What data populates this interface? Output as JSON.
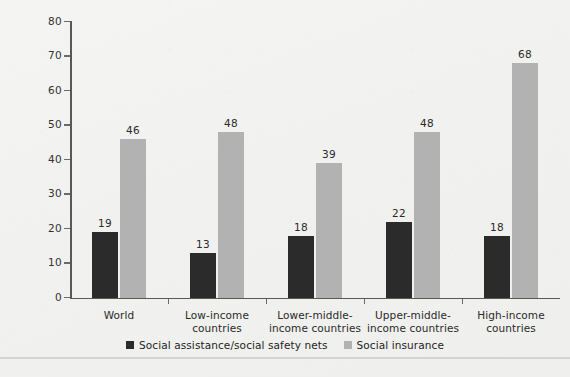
{
  "chart_data": {
    "type": "bar",
    "title": "",
    "xlabel": "",
    "ylabel": "Percent",
    "ylim": [
      0,
      80
    ],
    "ytick_step": 10,
    "yticks": [
      "0",
      "10",
      "20",
      "30",
      "40",
      "50",
      "60",
      "70",
      "80"
    ],
    "grid": false,
    "legend_position": "bottom-center",
    "categories": [
      "World",
      "Low-income countries",
      "Lower-middle-income countries",
      "Upper-middle-income countries",
      "High-income countries"
    ],
    "category_label_lines": [
      [
        "World"
      ],
      [
        "Low-income",
        "countries"
      ],
      [
        "Lower-middle-",
        "income countries"
      ],
      [
        "Upper-middle-",
        "income countries"
      ],
      [
        "High-income",
        "countries"
      ]
    ],
    "series": [
      {
        "name": "Social assistance/social safety nets",
        "color": "#2b2b2b",
        "values": [
          19,
          13,
          18,
          22,
          18
        ]
      },
      {
        "name": "Social insurance",
        "color": "#b2b2b2",
        "values": [
          46,
          48,
          39,
          48,
          68
        ]
      }
    ]
  },
  "axis": {
    "y_title": "Percent"
  },
  "legend": {
    "items": [
      {
        "label": "Social assistance/social safety nets",
        "color": "#2b2b2b"
      },
      {
        "label": "Social insurance",
        "color": "#b2b2b2"
      }
    ]
  }
}
